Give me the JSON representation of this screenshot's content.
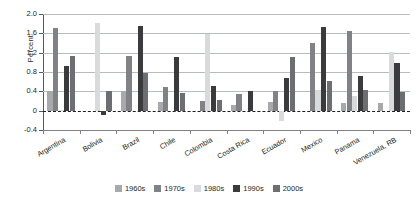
{
  "chart_data": {
    "type": "bar",
    "title": "",
    "xlabel": "",
    "ylabel": "Percent",
    "ylim": [
      -0.4,
      2.0
    ],
    "yticks": [
      2.0,
      1.6,
      1.2,
      0.8,
      0.4,
      0,
      -0.4
    ],
    "ytick_labels": [
      "2.0",
      "1.6",
      "1.2",
      "0.8",
      "0.4",
      "0",
      "-0.4"
    ],
    "grid": true,
    "zero_line": true,
    "legend_position": "bottom",
    "categories": [
      "Argentina",
      "Bolivia",
      "Brazil",
      "Chile",
      "Colombia",
      "Costa Rica",
      "Ecuador",
      "Mexico",
      "Panama",
      "Venezuela, RB"
    ],
    "series": [
      {
        "name": "1960s",
        "color": "#a7a9ac",
        "values": [
          0.4,
          0.0,
          0.4,
          0.17,
          0.0,
          0.12,
          0.18,
          0.0,
          0.15,
          0.15
        ]
      },
      {
        "name": "1970s",
        "color": "#808285",
        "values": [
          1.72,
          0.0,
          1.14,
          0.5,
          0.2,
          0.35,
          0.4,
          1.4,
          1.65,
          0.0
        ]
      },
      {
        "name": "1980s",
        "color": "#d9dadb",
        "values": [
          0.02,
          1.82,
          0.0,
          0.0,
          1.58,
          0.0,
          -0.22,
          0.42,
          0.3,
          1.22
        ]
      },
      {
        "name": "1990s",
        "color": "#3b3b3d",
        "values": [
          0.92,
          -0.08,
          1.75,
          1.12,
          0.52,
          0.4,
          0.68,
          1.74,
          0.72,
          0.98
        ]
      },
      {
        "name": "2000s",
        "color": "#6d6e71",
        "values": [
          1.14,
          0.4,
          0.78,
          0.36,
          0.22,
          0.0,
          1.12,
          0.62,
          0.42,
          0.38
        ]
      }
    ]
  },
  "legend": {
    "items": [
      {
        "label": "1960s",
        "color": "#a7a9ac"
      },
      {
        "label": "1970s",
        "color": "#808285"
      },
      {
        "label": "1980s",
        "color": "#d9dadb"
      },
      {
        "label": "1990s",
        "color": "#3b3b3d"
      },
      {
        "label": "2000s",
        "color": "#6d6e71"
      }
    ]
  }
}
